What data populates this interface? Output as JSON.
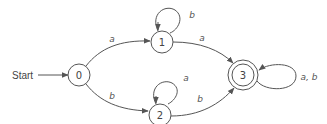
{
  "diagram": {
    "type": "DFA state diagram",
    "start_label": "Start",
    "states": [
      {
        "id": "0",
        "label": "0",
        "start": true,
        "accepting": false
      },
      {
        "id": "1",
        "label": "1",
        "start": false,
        "accepting": false
      },
      {
        "id": "2",
        "label": "2",
        "start": false,
        "accepting": false
      },
      {
        "id": "3",
        "label": "3",
        "start": false,
        "accepting": true
      }
    ],
    "transitions": [
      {
        "from": "0",
        "to": "1",
        "label": "a"
      },
      {
        "from": "0",
        "to": "2",
        "label": "b"
      },
      {
        "from": "1",
        "to": "1",
        "label": "b"
      },
      {
        "from": "1",
        "to": "3",
        "label": "a"
      },
      {
        "from": "2",
        "to": "2",
        "label": "a"
      },
      {
        "from": "2",
        "to": "3",
        "label": "b"
      },
      {
        "from": "3",
        "to": "3",
        "label": "a, b"
      }
    ]
  }
}
